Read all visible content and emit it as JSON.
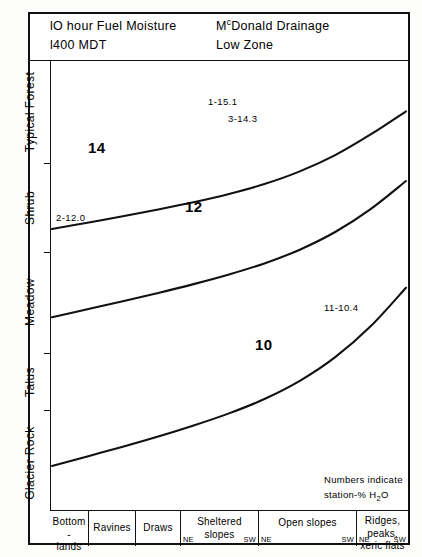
{
  "header": {
    "left_lines": [
      "lO hour Fuel Moisture",
      "l400 MDT"
    ],
    "right_line_1_pre": "M",
    "right_line_1_sup": "c",
    "right_line_1_post": "Donald Drainage",
    "right_line_2": "Low Zone"
  },
  "note": {
    "line1": "Numbers indicate",
    "line2_pre": "station-% H",
    "line2_sub": "2",
    "line2_post": "O"
  },
  "chart_data": {
    "type": "line",
    "xlabel": "",
    "ylabel": "",
    "grid": false,
    "legend": "inline-curve-labels",
    "ylabel_note": "Vegetation / habitat type zones ordered bottom-to-top",
    "categories": [
      "Bottom-lands",
      "Ravines",
      "Draws",
      "Sheltered slopes",
      "Open slopes",
      "Ridges, peaks, xeric flats"
    ],
    "category_endpoints": [
      "NE",
      "SW"
    ],
    "y_categories": [
      "Glacier Rock",
      "Talus",
      "Meadow",
      "Shrub",
      "Typical Forest"
    ],
    "series": [
      {
        "name": "14",
        "label": "14",
        "fuel_moisture_percent": 14,
        "points": [
          [
            0.0,
            0.595
          ],
          [
            0.1,
            0.572
          ],
          [
            0.2,
            0.549
          ],
          [
            0.3,
            0.524
          ],
          [
            0.4,
            0.498
          ],
          [
            0.5,
            0.468
          ],
          [
            0.6,
            0.432
          ],
          [
            0.7,
            0.386
          ],
          [
            0.8,
            0.327
          ],
          [
            0.9,
            0.252
          ],
          [
            1.0,
            0.168
          ]
        ]
      },
      {
        "name": "12",
        "label": "12",
        "fuel_moisture_percent": 12,
        "points": [
          [
            0.0,
            0.915
          ],
          [
            0.1,
            0.886
          ],
          [
            0.2,
            0.857
          ],
          [
            0.3,
            0.827
          ],
          [
            0.4,
            0.795
          ],
          [
            0.5,
            0.76
          ],
          [
            0.6,
            0.72
          ],
          [
            0.7,
            0.67
          ],
          [
            0.8,
            0.606
          ],
          [
            0.9,
            0.523
          ],
          [
            1.0,
            0.421
          ]
        ]
      },
      {
        "name": "10",
        "label": "10",
        "fuel_moisture_percent": 10,
        "points": [
          [
            0.0,
            1.455
          ],
          [
            0.1,
            1.42
          ],
          [
            0.2,
            1.385
          ],
          [
            0.3,
            1.348
          ],
          [
            0.4,
            1.308
          ],
          [
            0.5,
            1.264
          ],
          [
            0.6,
            1.212
          ],
          [
            0.7,
            1.146
          ],
          [
            0.8,
            1.06
          ],
          [
            0.9,
            0.948
          ],
          [
            1.0,
            0.808
          ]
        ]
      }
    ],
    "annotations": [
      {
        "text": "1-15.1",
        "station": 1,
        "value": 15.1
      },
      {
        "text": "3-14.3",
        "station": 3,
        "value": 14.3
      },
      {
        "text": "2-12.0",
        "station": 2,
        "value": 12.0
      },
      {
        "text": "11-10.4",
        "station": 11,
        "value": 10.4
      }
    ]
  },
  "y_axis": {
    "labels": [
      {
        "text": "Typical Forest"
      },
      {
        "text": "Shrub"
      },
      {
        "text": "Meadow"
      },
      {
        "text": "Talus"
      },
      {
        "text": "Glacier Rock"
      }
    ]
  },
  "x_axis": {
    "cells": [
      {
        "name": "Bottom -\nlands",
        "line1": "Bottom -",
        "line2": "lands",
        "ne": "",
        "sw": ""
      },
      {
        "name": "Ravines",
        "line1": "Ravines",
        "line2": "",
        "ne": "",
        "sw": ""
      },
      {
        "name": "Draws",
        "line1": "Draws",
        "line2": "",
        "ne": "",
        "sw": ""
      },
      {
        "name": "Sheltered slopes",
        "line1": "Sheltered",
        "line2": "slopes",
        "ne": "NE",
        "sw": "SW"
      },
      {
        "name": "Open slopes",
        "line1": "Open slopes",
        "line2": "",
        "ne": "NE",
        "sw": "SW"
      },
      {
        "name": "Ridges, peaks, xeric flats",
        "line1": "Ridges, peaks,",
        "line2": "xeric flats",
        "ne": "NE",
        "sw": "SW"
      }
    ]
  },
  "curve_labels": [
    {
      "text": "14"
    },
    {
      "text": "12"
    },
    {
      "text": "10"
    }
  ],
  "station_labels": [
    {
      "text": "1-15.1"
    },
    {
      "text": "3-14.3"
    },
    {
      "text": "2-12.0"
    },
    {
      "text": "11-10.4"
    }
  ],
  "colors": {
    "ink": "#111111",
    "paper": "#ffffff"
  }
}
